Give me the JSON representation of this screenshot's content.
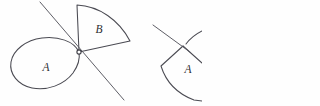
{
  "figure": {
    "background_color": "#fefefe",
    "ink_color": "#4a4a52",
    "labels": {
      "blob_label": "A",
      "sector_label": "B",
      "right_sector_label": "A"
    },
    "left_diagram": {
      "blob": {
        "name": "region-a-blob",
        "path": "M 79 52 C 74 41 58 36 42 38 C 26 40 13 50 11 62 C 9 74 18 85 32 88 C 47 91 64 85 73 73 C 78 66 80 58 79 52 Z",
        "label": "A",
        "label_x": 46,
        "label_y": 71
      },
      "sector": {
        "name": "region-b-sector",
        "path": "M 79 52 L 77 5 C 99 6 119 20 130 41 Z",
        "label": "B",
        "label_x": 99,
        "label_y": 33
      },
      "tangent_line": {
        "name": "tangent-line",
        "x1": 40,
        "y1": 2,
        "x2": 124,
        "y2": 100
      },
      "vertex": {
        "name": "vertex-point",
        "cx": 79,
        "cy": 52,
        "r": 2.1
      }
    },
    "right_diagram": {
      "sector": {
        "name": "right-region-a-sector",
        "path": "M 183 46 L 161 66 C 166 82 178 94 194 100 L 202 101"
      },
      "arc_top": {
        "name": "right-arc-top",
        "path": "M 186 44 C 192 36 200 32 202 31"
      },
      "line": {
        "name": "right-tangent-line",
        "x1": 153,
        "y1": 25,
        "x2": 190,
        "y2": 52
      },
      "edge_right": {
        "name": "right-sector-edge",
        "path": "M 183 46 L 202 63"
      },
      "label": "A",
      "label_x": 188,
      "label_y": 73
    }
  }
}
